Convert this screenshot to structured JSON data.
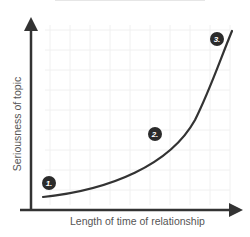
{
  "diagram": {
    "y_axis_label": "Seriousness of topic",
    "x_axis_label": "Length of time of relationship",
    "markers": [
      {
        "label": "1.",
        "x": 49,
        "y": 183
      },
      {
        "label": "2.",
        "x": 155,
        "y": 134
      },
      {
        "label": "3.",
        "x": 217,
        "y": 39
      }
    ],
    "colors": {
      "axis": "#333333",
      "curve": "#333333",
      "grid": "#eeeeee",
      "marker_bg": "#2b2b2b",
      "label_text": "#555555"
    }
  }
}
